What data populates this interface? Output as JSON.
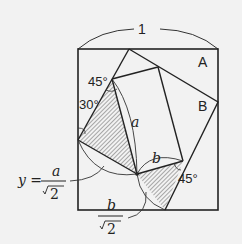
{
  "diagram": {
    "top_label": "1",
    "region_a": "A",
    "region_b": "B",
    "angle_top_left": "45°",
    "angle_left": "30°",
    "angle_bottom_right": "45°",
    "segment_a": "a",
    "segment_b": "b",
    "y_formula": {
      "lhs": "y =",
      "numerator": "a",
      "denominator": "2"
    },
    "b_formula": {
      "numerator": "b",
      "denominator": "2"
    }
  }
}
